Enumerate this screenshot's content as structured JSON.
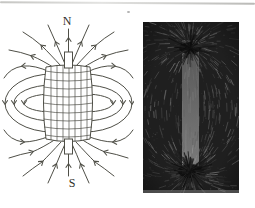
{
  "page": {
    "background": "#ffffff",
    "edge_line_color": "#b9b9b4"
  },
  "diagram": {
    "north_label": "N",
    "south_label": "S",
    "line_color": "#4f4f47",
    "label_color": "#2e2e2a"
  },
  "photo": {
    "width": 96,
    "height": 171,
    "background": "#1f1f1f",
    "magnet_color": "#6b6b6b",
    "pole_blob_color": "#0c0c0c",
    "streak_gray_min": 70,
    "streak_gray_max": 165,
    "top_pole": {
      "x": 47,
      "y": 26
    },
    "bottom_pole": {
      "x": 47,
      "y": 149
    },
    "magnet_bar": {
      "x": 39,
      "y": 18,
      "width": 17,
      "height": 134
    }
  }
}
